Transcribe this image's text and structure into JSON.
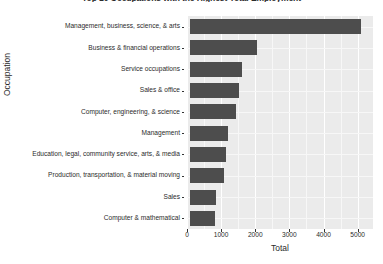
{
  "chart_data": {
    "type": "bar",
    "orientation": "horizontal",
    "title": "Top 10 Occupations with the Highest Total Employment",
    "xlabel": "Total",
    "ylabel": "Occupation",
    "categories": [
      "Management, business, science, & arts",
      "Business & financial operations",
      "Service occupations",
      "Sales & office",
      "Computer, engineering, & science",
      "Management",
      "Education, legal, community service, arts, & media",
      "Production, transportation, & material moving",
      "Sales",
      "Computer & mathematical"
    ],
    "values": [
      5090,
      2050,
      1615,
      1520,
      1440,
      1190,
      1150,
      1075,
      840,
      835
    ],
    "xlim": [
      0,
      5450
    ],
    "xticks": [
      0,
      1000,
      2000,
      3000,
      4000,
      5000
    ],
    "xtick_labels": [
      "0",
      "1000",
      "2000",
      "3000",
      "4000",
      "5000"
    ],
    "grid": true,
    "legend": null,
    "bar_color": "#4d4d4d",
    "panel_color": "#ebebeb",
    "gridline_color": "#ffffff",
    "text_color": "#2b2b2b"
  }
}
